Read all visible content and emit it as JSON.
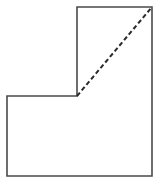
{
  "figure": {
    "name": "l-shaped-polygon-with-dashed-diagonal",
    "canvas": {
      "width": 162,
      "height": 184,
      "background_color": "#ffffff"
    },
    "outline": {
      "name": "l-shape-outline",
      "stroke_color": "#4a4a4a",
      "stroke_width": 1.6,
      "fill_color": "#ffffff",
      "points": "77,7 152,7 152,176 7,176 7,96 77,96",
      "vertices": [
        {
          "label": "notch-top-left",
          "x": 77,
          "y": 7
        },
        {
          "label": "top-right",
          "x": 152,
          "y": 7
        },
        {
          "label": "bottom-right",
          "x": 152,
          "y": 176
        },
        {
          "label": "bottom-left",
          "x": 7,
          "y": 176
        },
        {
          "label": "left-arm-top-left",
          "x": 7,
          "y": 96
        },
        {
          "label": "inner-reflex-corner",
          "x": 77,
          "y": 96
        }
      ]
    },
    "diagonal": {
      "name": "dashed-diagonal",
      "stroke_color": "#2b2b2b",
      "stroke_width": 2.0,
      "dash_pattern": "4.5 2.8",
      "x1": 77,
      "y1": 96,
      "x2": 152,
      "y2": 7
    }
  }
}
